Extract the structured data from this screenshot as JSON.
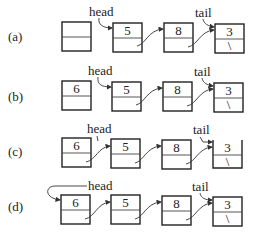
{
  "rows": [
    {
      "label": "(a)",
      "nodes": [
        {
          "value": "",
          "link": ""
        },
        {
          "value": "5",
          "link": ""
        },
        {
          "value": "8",
          "link": ""
        },
        {
          "value": "3",
          "link": "\\"
        }
      ],
      "head_label": "head",
      "tail_label": "tail",
      "head_points_to": 1,
      "tail_points_to": 3
    },
    {
      "label": "(b)",
      "nodes": [
        {
          "value": "6",
          "link": ""
        },
        {
          "value": "5",
          "link": ""
        },
        {
          "value": "8",
          "link": ""
        },
        {
          "value": "3",
          "link": "\\"
        }
      ],
      "head_label": "head",
      "tail_label": "tail",
      "head_points_to": 1,
      "tail_points_to": 3
    },
    {
      "label": "(c)",
      "nodes": [
        {
          "value": "6",
          "link": ""
        },
        {
          "value": "5",
          "link": ""
        },
        {
          "value": "8",
          "link": ""
        },
        {
          "value": "3",
          "link": "\\"
        }
      ],
      "head_label": "head",
      "tail_label": "tail",
      "head_points_to": 1,
      "tail_points_to": 3
    },
    {
      "label": "(d)",
      "nodes": [
        {
          "value": "6",
          "link": ""
        },
        {
          "value": "5",
          "link": ""
        },
        {
          "value": "8",
          "link": ""
        },
        {
          "value": "3",
          "link": "\\"
        }
      ],
      "head_label": "head",
      "tail_label": "tail",
      "head_points_to": 0,
      "tail_points_to": 3
    }
  ]
}
